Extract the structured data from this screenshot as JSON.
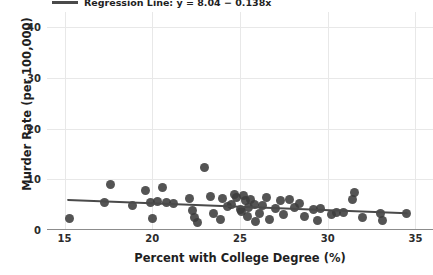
{
  "chart_data": {
    "type": "scatter",
    "title": "",
    "xlabel": "Percent with College Degree (%)",
    "ylabel": "Murder Rate (per 100,000)",
    "xlim": [
      14.0,
      36.0
    ],
    "ylim": [
      0,
      43
    ],
    "xticks": [
      15,
      20,
      25,
      30,
      35
    ],
    "yticks": [
      0,
      10,
      20,
      30,
      40
    ],
    "xtick_labels": [
      "15",
      "20",
      "25",
      "30",
      "35"
    ],
    "ytick_labels": [
      "0",
      "10",
      "20",
      "30",
      "40"
    ],
    "grid": true,
    "legend_position": "upper left",
    "point_color": "#3c3c3c",
    "line_color": "#4a4a4a",
    "grid_color": "#e8e8e8",
    "legend": [
      {
        "label": "Regression Line: y = 8.04 − 0.138x",
        "marker": "line"
      }
    ],
    "fit": {
      "intercept": 8.04,
      "slope": -0.138,
      "x_start": 15.2,
      "x_end": 34.5,
      "y_start": 5.94,
      "y_end": 3.28
    },
    "points": [
      {
        "x": 15.3,
        "y": 2.3
      },
      {
        "x": 17.3,
        "y": 5.4
      },
      {
        "x": 17.6,
        "y": 9.0
      },
      {
        "x": 18.9,
        "y": 4.9
      },
      {
        "x": 19.6,
        "y": 7.7
      },
      {
        "x": 19.9,
        "y": 5.4
      },
      {
        "x": 20.0,
        "y": 2.2
      },
      {
        "x": 20.3,
        "y": 5.6
      },
      {
        "x": 20.6,
        "y": 8.3
      },
      {
        "x": 20.8,
        "y": 5.5
      },
      {
        "x": 21.2,
        "y": 5.2
      },
      {
        "x": 22.1,
        "y": 6.3
      },
      {
        "x": 22.3,
        "y": 3.9
      },
      {
        "x": 22.4,
        "y": 2.4
      },
      {
        "x": 22.6,
        "y": 1.4
      },
      {
        "x": 23.0,
        "y": 12.3
      },
      {
        "x": 23.3,
        "y": 6.6
      },
      {
        "x": 23.5,
        "y": 3.2
      },
      {
        "x": 23.9,
        "y": 2.0
      },
      {
        "x": 24.0,
        "y": 6.2
      },
      {
        "x": 24.3,
        "y": 4.6
      },
      {
        "x": 24.5,
        "y": 5.0
      },
      {
        "x": 24.7,
        "y": 7.1
      },
      {
        "x": 24.8,
        "y": 6.5
      },
      {
        "x": 25.0,
        "y": 4.1
      },
      {
        "x": 25.1,
        "y": 3.6
      },
      {
        "x": 25.2,
        "y": 6.9
      },
      {
        "x": 25.3,
        "y": 5.8
      },
      {
        "x": 25.4,
        "y": 2.6
      },
      {
        "x": 25.5,
        "y": 4.4
      },
      {
        "x": 25.6,
        "y": 6.0
      },
      {
        "x": 25.8,
        "y": 5.1
      },
      {
        "x": 25.9,
        "y": 1.6
      },
      {
        "x": 26.1,
        "y": 3.3
      },
      {
        "x": 26.3,
        "y": 4.8
      },
      {
        "x": 26.5,
        "y": 6.4
      },
      {
        "x": 26.7,
        "y": 2.1
      },
      {
        "x": 27.0,
        "y": 4.3
      },
      {
        "x": 27.3,
        "y": 5.9
      },
      {
        "x": 27.5,
        "y": 3.0
      },
      {
        "x": 27.8,
        "y": 6.1
      },
      {
        "x": 28.1,
        "y": 4.5
      },
      {
        "x": 28.4,
        "y": 5.3
      },
      {
        "x": 28.7,
        "y": 2.7
      },
      {
        "x": 29.2,
        "y": 4.0
      },
      {
        "x": 29.4,
        "y": 1.9
      },
      {
        "x": 29.6,
        "y": 4.2
      },
      {
        "x": 30.2,
        "y": 3.1
      },
      {
        "x": 30.5,
        "y": 3.4
      },
      {
        "x": 30.9,
        "y": 3.5
      },
      {
        "x": 31.4,
        "y": 6.0
      },
      {
        "x": 31.5,
        "y": 7.4
      },
      {
        "x": 32.0,
        "y": 2.5
      },
      {
        "x": 33.0,
        "y": 3.3
      },
      {
        "x": 33.1,
        "y": 1.8
      },
      {
        "x": 34.5,
        "y": 3.3
      }
    ]
  }
}
